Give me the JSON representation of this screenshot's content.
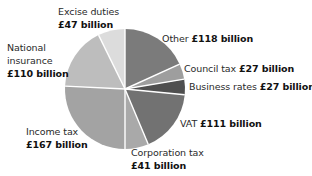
{
  "chart_data": {
    "type": "pie",
    "title": "",
    "unit": "£ billion",
    "start_angle_deg": 0,
    "direction": "clockwise",
    "slices": [
      {
        "label": "Other",
        "value": 118,
        "display": "£118 billion",
        "color": "#7b7b7b"
      },
      {
        "label": "Council tax",
        "value": 27,
        "display": "£27 billion",
        "color": "#9e9e9e"
      },
      {
        "label": "Business rates",
        "value": 27,
        "display": "£27 billion",
        "color": "#4f4f4f"
      },
      {
        "label": "VAT",
        "value": 111,
        "display": "£111 billion",
        "color": "#727272"
      },
      {
        "label": "Corporation tax",
        "value": 41,
        "display": "£41 billion",
        "color": "#a9a9a9"
      },
      {
        "label": "Income tax",
        "value": 167,
        "display": "£167 billion",
        "color": "#a3a3a3"
      },
      {
        "label": "National insurance",
        "value": 110,
        "display": "£110 billion",
        "color": "#bdbdbd"
      },
      {
        "label": "Excise duties",
        "value": 47,
        "display": "£47 billion",
        "color": "#dcdcdc"
      }
    ],
    "total": 648,
    "legend": "none (direct labels)"
  },
  "labels": {
    "other": {
      "name": "Other",
      "value": "£118 billion"
    },
    "council": {
      "name": "Council tax",
      "value": "£27 billion"
    },
    "business": {
      "name": "Business rates",
      "value": "£27 billion"
    },
    "vat": {
      "name": "VAT",
      "value": "£111 billion"
    },
    "corporation": {
      "name": "Corporation tax",
      "value": "£41 billion"
    },
    "income": {
      "name": "Income tax",
      "value": "£167 billion"
    },
    "ni": {
      "line1": "National",
      "line2": "insurance",
      "value": "£110 billion"
    },
    "excise": {
      "name": "Excise duties",
      "value": "£47 billion"
    }
  },
  "geometry": {
    "cx": 125,
    "cy": 89,
    "r": 60,
    "divider_color": "#ffffff"
  }
}
